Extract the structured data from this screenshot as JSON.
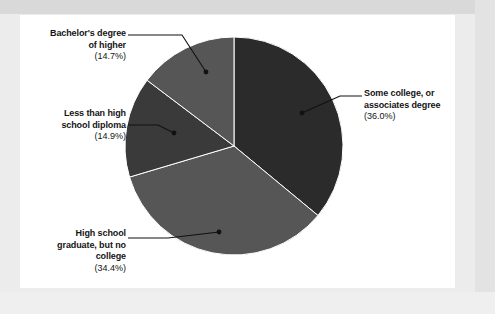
{
  "document": {
    "background_color": "#ececed",
    "card_color": "#ffffff"
  },
  "chart_data": {
    "type": "pie",
    "title": "",
    "subtitle": "",
    "xlabel": "",
    "ylabel": "",
    "legend_position": "callout-labels",
    "grid": false,
    "units": "percent",
    "start_angle_deg": 0,
    "direction": "clockwise",
    "categories": [
      "Some college, or associates degree",
      "High school graduate, but no college",
      "Less than high school diploma",
      "Bachelor's degree of higher"
    ],
    "values": [
      36.0,
      34.4,
      14.9,
      14.7
    ],
    "colors": [
      "#2b2b2b",
      "#565656",
      "#3a3a3a",
      "#565656"
    ],
    "slices": [
      {
        "label": "Some college, or associates degree",
        "line1": "Some college, or",
        "line2": "associates degree",
        "percent_text": "(36.0%)",
        "value": 36.0,
        "color": "#2b2b2b",
        "start_deg": 0.0,
        "end_deg": 129.6
      },
      {
        "label": "High school graduate, but no college",
        "line1": "High school",
        "line2": "graduate, but no",
        "line3": "college",
        "percent_text": "(34.4%)",
        "value": 34.4,
        "color": "#565656",
        "start_deg": 129.6,
        "end_deg": 253.44
      },
      {
        "label": "Less than high school diploma",
        "line1": "Less than high",
        "line2": "school diploma",
        "percent_text": "(14.9%)",
        "value": 14.9,
        "color": "#3a3a3a",
        "start_deg": 253.44,
        "end_deg": 307.08
      },
      {
        "label": "Bachelor's degree of higher",
        "line1": "Bachelor's degree",
        "line2": "of higher",
        "percent_text": "(14.7%)",
        "value": 14.7,
        "color": "#565656",
        "start_deg": 307.08,
        "end_deg": 360.0
      }
    ]
  }
}
